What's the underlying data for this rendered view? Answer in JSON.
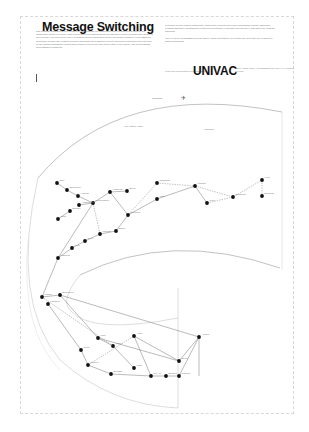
{
  "page": {
    "title": "Message Switching",
    "left_column_text": "Das Message Switching ist eine Technik zur Übertragung von Nachrichten über ein Netz von Rechnern. Die Nachrichten werden in einem Knoten gespeichert und anschließend zum nächsten Knoten weitergeleitet, bis sie ihr Ziel erreichen. Mit dem neuen UNIVAC-System können Nachrichten sicher und schnell zwischen vielen Stationen übertragen werden. Ein zentraler Rechner überwacht den gesamten Verkehr, speichert Meldungen und verteilt sie an die richtigen Empfänger. Das System arbeitet rund um die Uhr, sieben Tage in der Woche, und ist auf höchste Zuverlässigkeit ausgelegt.",
    "right_column_text_1": "Leitungen werden optimal ausgenutzt, Wartezeiten verkürzt und Fehler automatisch erkannt. Zahlreiche Fluggesellschaften und Behörden in Europa und Übersee verwenden bereits UNIVAC-Systeme für Message Switching.",
    "right_column_text_2": "UNIVAC ist ein Geschäftsbereich der Sperry Rand Corporation. Wir beraten Sie gern über alle Fragen der Datenverarbeitung.",
    "univac_prefix": "Mehr über Nachrichtenvermittlung durch",
    "brand": "UNIVAC",
    "univac_suffix": "Sperry Rand GmbH, Geschäftsbereich UNIVAC, Frankfurt am Main"
  },
  "map": {
    "top_label": "LONDON",
    "region_labels": [
      "SKANDINAVIEN",
      "EUROPA"
    ],
    "nodes": [
      {
        "x": 57,
        "y": 183,
        "label": "Oslo"
      },
      {
        "x": 67,
        "y": 190,
        "label": "Stockholm"
      },
      {
        "x": 78,
        "y": 196,
        "label": "Helsinki"
      },
      {
        "x": 93,
        "y": 203,
        "label": "Kopenhagen"
      },
      {
        "x": 110,
        "y": 192,
        "label": "Hamburg"
      },
      {
        "x": 127,
        "y": 191,
        "label": "Berlin"
      },
      {
        "x": 157,
        "y": 183,
        "label": "Warschau"
      },
      {
        "x": 157,
        "y": 199,
        "label": "Prag"
      },
      {
        "x": 195,
        "y": 186,
        "label": "Moskau"
      },
      {
        "x": 207,
        "y": 203,
        "label": "Wien"
      },
      {
        "x": 233,
        "y": 197,
        "label": "Budapest"
      },
      {
        "x": 262,
        "y": 180,
        "label": "Kiew"
      },
      {
        "x": 262,
        "y": 196,
        "label": "Bukarest"
      },
      {
        "x": 79,
        "y": 205,
        "label": "Amsterdam"
      },
      {
        "x": 70,
        "y": 211,
        "label": "Brüssel"
      },
      {
        "x": 58,
        "y": 219,
        "label": "Paris"
      },
      {
        "x": 128,
        "y": 215,
        "label": "München"
      },
      {
        "x": 116,
        "y": 231,
        "label": "Zürich"
      },
      {
        "x": 100,
        "y": 234,
        "label": "Mailand"
      },
      {
        "x": 85,
        "y": 241,
        "label": "Genf"
      },
      {
        "x": 72,
        "y": 248,
        "label": "Lyon"
      },
      {
        "x": 58,
        "y": 258,
        "label": "Marseille"
      },
      {
        "x": 42,
        "y": 297,
        "label": "Madrid"
      },
      {
        "x": 48,
        "y": 304,
        "label": "Lissabon"
      },
      {
        "x": 60,
        "y": 295,
        "label": "Barcelona"
      },
      {
        "x": 98,
        "y": 338,
        "label": "Rom"
      },
      {
        "x": 113,
        "y": 346,
        "label": "Athen"
      },
      {
        "x": 134,
        "y": 368,
        "label": "Kairo"
      },
      {
        "x": 151,
        "y": 376,
        "label": "Tel Aviv"
      },
      {
        "x": 179,
        "y": 361,
        "label": "Beirut"
      },
      {
        "x": 199,
        "y": 337,
        "label": "Ankara"
      },
      {
        "x": 134,
        "y": 336,
        "label": "Algier"
      },
      {
        "x": 81,
        "y": 350,
        "label": "Tunis"
      },
      {
        "x": 88,
        "y": 365,
        "label": "Tripolis"
      },
      {
        "x": 111,
        "y": 374,
        "label": "Bengasi"
      },
      {
        "x": 166,
        "y": 376,
        "label": "Bagdad"
      },
      {
        "x": 179,
        "y": 376,
        "label": "Teheran"
      }
    ]
  }
}
